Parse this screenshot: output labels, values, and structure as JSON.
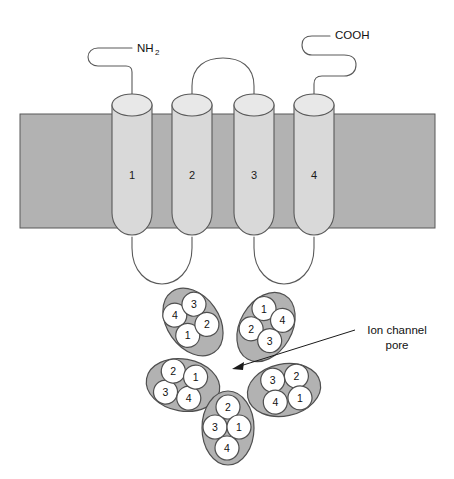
{
  "figure": {
    "membrane": {
      "name": "lipid-membrane-band"
    },
    "topology": {
      "helices": [
        {
          "label": "1"
        },
        {
          "label": "2"
        },
        {
          "label": "3"
        },
        {
          "label": "4"
        }
      ],
      "n_terminus": {
        "label": "NH",
        "subscript": "2"
      },
      "c_terminus": {
        "label": "COOH"
      }
    },
    "pore_assembly": {
      "callout": {
        "line1": "Ion channel",
        "line2": "pore"
      },
      "subunits": [
        {
          "name": "subunit-top-left",
          "domains": [
            "4",
            "3",
            "1",
            "2"
          ]
        },
        {
          "name": "subunit-top-right",
          "domains": [
            "1",
            "4",
            "2",
            "3"
          ]
        },
        {
          "name": "subunit-left",
          "domains": [
            "3",
            "2",
            "4",
            "1"
          ]
        },
        {
          "name": "subunit-right",
          "domains": [
            "2",
            "1",
            "3",
            "4"
          ]
        },
        {
          "name": "subunit-bottom",
          "domains": [
            "2",
            "3",
            "1",
            "4"
          ]
        }
      ]
    },
    "colors": {
      "membrane_fill": "#b2b2b2",
      "helix_fill": "#d9d9d9",
      "subunit_fill": "#b2b2b2",
      "domain_fill": "#ffffff",
      "outline": "#4f4f4f"
    }
  }
}
